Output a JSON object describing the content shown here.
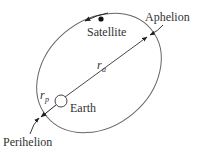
{
  "diagram": {
    "labels": {
      "satellite": "Satellite",
      "aphelion": "Aphelion",
      "perihelion": "Perihelion",
      "earth": "Earth",
      "r_a_main": "r",
      "r_a_sub": "a",
      "r_p_main": "r",
      "r_p_sub": "p"
    },
    "colors": {
      "orbit_line": "#666666",
      "ink": "#222222",
      "text": "#333333",
      "background": "#ffffff"
    },
    "elements": {
      "orbit": "ellipse",
      "central_body": "Earth (small circle at focus)",
      "satellite": "filled dot on orbit near top",
      "direction_arrow": "counterclockwise motion arrow above satellite",
      "radius_apogee": "line from Earth to aphelion labeled r_a",
      "radius_perigee": "short line from Earth to perihelion labeled r_p"
    }
  }
}
